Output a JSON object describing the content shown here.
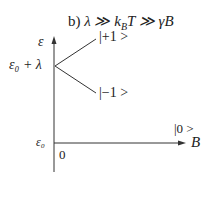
{
  "title_parts": {
    "prefix": "b) ",
    "formula": "λ ≫ k",
    "sub": "B",
    "rest": "T ≫ γB"
  },
  "axes": {
    "y_label": "ε",
    "x_label": "B",
    "y_tick_upper": "ε₀ + λ",
    "y_tick_origin": "ε₀",
    "x_origin": "0"
  },
  "states": {
    "upper": "|+1 >",
    "lower": "|−1 >",
    "zero": "|0 >"
  },
  "colors": {
    "line": "#333333",
    "background": "#ffffff"
  }
}
